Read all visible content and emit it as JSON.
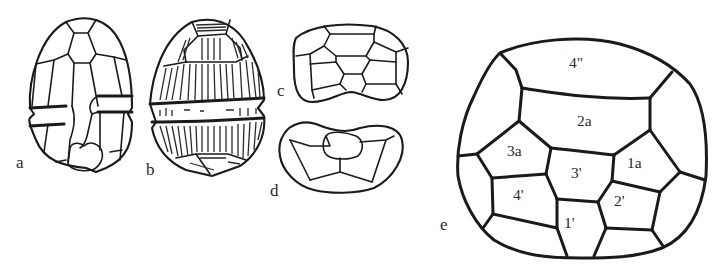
{
  "figure": {
    "panels": [
      {
        "id": "a",
        "label": "a",
        "description": "ventral view of cell, plate tabulation outline"
      },
      {
        "id": "b",
        "label": "b",
        "description": "striated theca, dorsal view"
      },
      {
        "id": "c",
        "label": "c",
        "description": "apical view"
      },
      {
        "id": "d",
        "label": "d",
        "description": "antapical view"
      },
      {
        "id": "e",
        "label": "e",
        "description": "enlarged apical view with plate designations"
      }
    ],
    "plate_labels": {
      "p4pp": "4\"",
      "p2a": "2a",
      "p3a": "3a",
      "p3p": "3'",
      "p1a": "1a",
      "p4p": "4'",
      "p2p": "2'",
      "p1p": "1'"
    },
    "colors": {
      "ink": "#1a1a1a",
      "background": "#ffffff"
    }
  }
}
